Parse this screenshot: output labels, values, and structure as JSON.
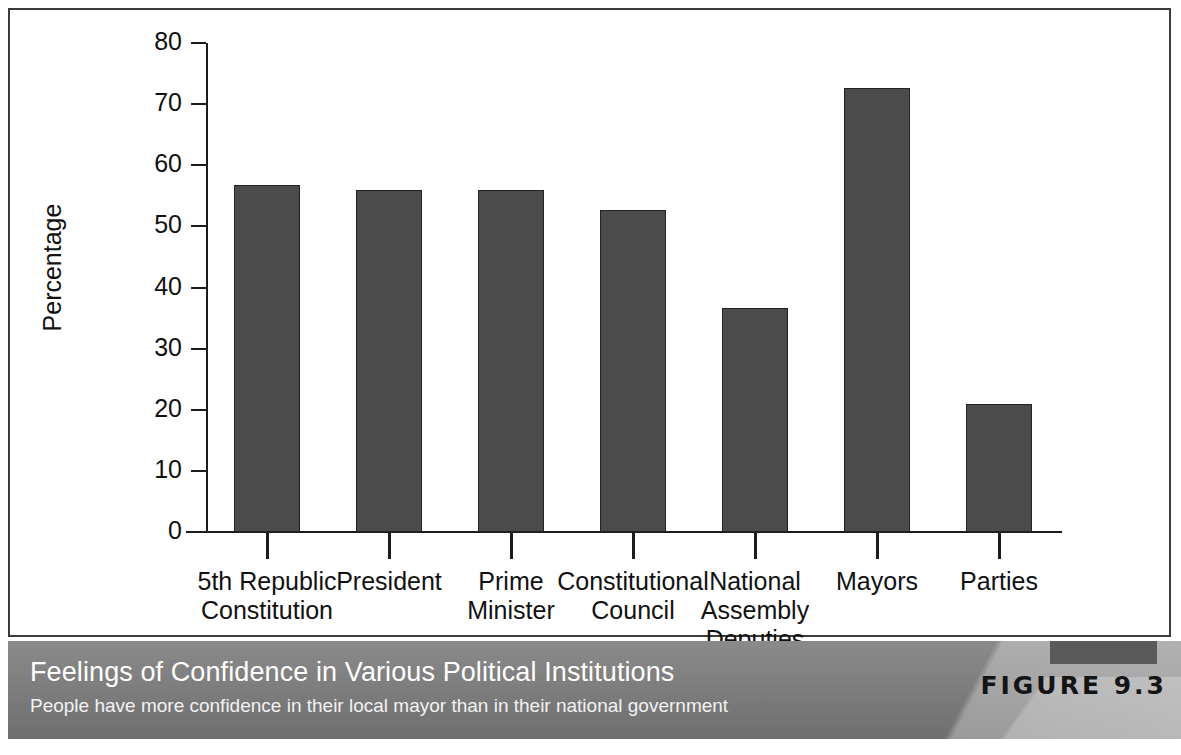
{
  "chart_data": {
    "type": "bar",
    "title": "Feelings of Confidence in Various Political Institutions",
    "subtitle": "People have more confidence in their local mayor than in their national government",
    "figure_label": "FIGURE 9.3",
    "xlabel": "",
    "ylabel": "Percentage",
    "ylim": [
      0,
      80
    ],
    "yticks": [
      0,
      10,
      20,
      30,
      40,
      50,
      60,
      70,
      80
    ],
    "grid": false,
    "legend": false,
    "bar_color": "#4b4b4b",
    "categories": [
      "5th Republic\nConstitution",
      "President",
      "Prime\nMinister",
      "Constitutional\nCouncil",
      "National\nAssembly\nDeputies",
      "Mayors",
      "Parties"
    ],
    "values": [
      56.8,
      55.9,
      55.9,
      52.7,
      36.6,
      72.6,
      20.9
    ]
  },
  "axis": {
    "y_title": "Percentage",
    "y_tick_labels": [
      "80",
      "70",
      "60",
      "50",
      "40",
      "30",
      "20",
      "10",
      "0"
    ]
  },
  "caption": {
    "title": "Feelings of Confidence in Various Political Institutions",
    "subtitle": "People have more confidence in their local mayor than in their national government",
    "figure_number": "FIGURE 9.3"
  },
  "colors": {
    "bar": "#4b4b4b",
    "bar_border": "#232323",
    "axis": "#1c1c1c",
    "banner": "#7e7e7e",
    "panel_border": "#3c3c3c"
  }
}
